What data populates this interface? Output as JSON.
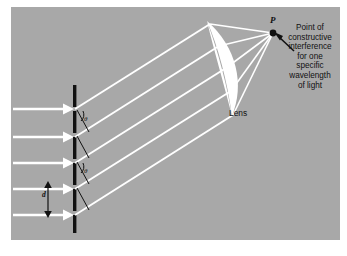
{
  "figure": {
    "background_color": "#a8a8a8",
    "page_color": "#ffffff",
    "ray_color": "#ffffff",
    "grating_color": "#111111",
    "lens_color": "#ffffff",
    "label_color": "#111111"
  },
  "labels": {
    "point_p": "P",
    "lens": "Lens",
    "annotation": "Point of constructive interference for one specific wavelength of light",
    "annotation_lines": [
      "Point of",
      "constructive",
      "interference",
      "for one",
      "specific",
      "wavelength",
      "of light"
    ],
    "theta_1": "θ",
    "theta_2": "θ",
    "slit_spacing": "d"
  },
  "elements": {
    "incoming_ray_count": 5,
    "diffracted_ray_count": 5,
    "converging_ray_count": 5,
    "grating_label": "diffraction-grating",
    "focal_point_label": "point-p"
  }
}
